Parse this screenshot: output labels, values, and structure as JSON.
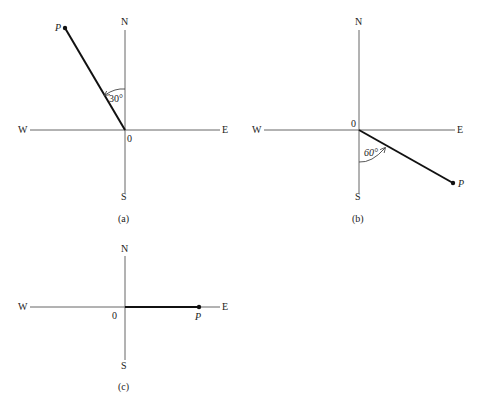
{
  "panels": [
    {
      "id": "a",
      "caption": "(a)",
      "labels": {
        "N": "N",
        "S": "S",
        "E": "E",
        "W": "W",
        "origin": "0",
        "point": "P"
      },
      "angle_label": "30°",
      "angle_deg": 30,
      "angle_reference": "N",
      "direction": "30° west of north"
    },
    {
      "id": "b",
      "caption": "(b)",
      "labels": {
        "N": "N",
        "S": "S",
        "E": "E",
        "W": "W",
        "origin": "0",
        "point": "P"
      },
      "angle_label": "60°",
      "angle_deg": 60,
      "angle_reference": "S",
      "direction": "60° east of south"
    },
    {
      "id": "c",
      "caption": "(c)",
      "labels": {
        "N": "N",
        "S": "S",
        "E": "E",
        "W": "W",
        "origin": "0",
        "point": "P"
      },
      "angle_label": "",
      "direction": "due east"
    }
  ]
}
